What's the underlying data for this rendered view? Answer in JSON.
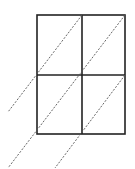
{
  "diagram": {
    "grid": {
      "left": 37,
      "top": 15,
      "right": 125,
      "bottom": 134,
      "mid_x": 82,
      "mid_y": 75,
      "stroke": "#222222"
    },
    "dashed_lines": [
      {
        "x1": 82,
        "y1": 15,
        "x2": 8,
        "y2": 112
      },
      {
        "x1": 125,
        "y1": 15,
        "x2": 8,
        "y2": 168
      },
      {
        "x1": 125,
        "y1": 75,
        "x2": 55,
        "y2": 168
      }
    ],
    "dash_color": "#555555"
  }
}
